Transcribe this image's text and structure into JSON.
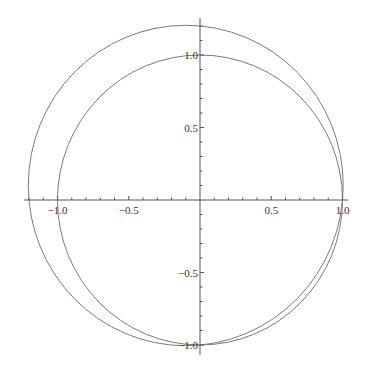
{
  "chart_data": {
    "type": "line",
    "title": "",
    "xlabel": "",
    "ylabel": "",
    "xlim": [
      -1.24,
      1.04
    ],
    "ylim": [
      -1.07,
      1.26
    ],
    "grid": false,
    "legend": null,
    "x_ticks": [
      -1.0,
      -0.5,
      0.5,
      1.0
    ],
    "x_tick_labels": [
      "-1.0",
      "-0.5",
      "0.5",
      "1.0"
    ],
    "y_ticks": [
      1.0,
      0.5,
      -0.5,
      -1.0
    ],
    "y_tick_labels": [
      "1.0",
      "0.5",
      "-0.5",
      "-1.0"
    ],
    "series": [
      {
        "name": "unit circle",
        "shape": "circle",
        "center": [
          0.0,
          0.0
        ],
        "radius": 1.0,
        "color": "#7a7a7a"
      },
      {
        "name": "outer circle",
        "shape": "circle",
        "center": [
          -0.1,
          0.1
        ],
        "radius": 1.105,
        "color": "#7a7a7a"
      }
    ],
    "annotations": [
      "Both circles pass through (1, 0) and (0, -1)"
    ]
  },
  "layout": {
    "origin_px": [
      200,
      200
    ],
    "unit_x_px": 142.5,
    "unit_y_px": 145,
    "x_axis_px": [
      24,
      348
    ],
    "y_axis_px": [
      18,
      355
    ]
  }
}
